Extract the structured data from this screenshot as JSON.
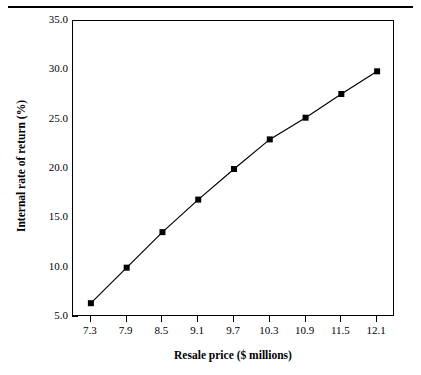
{
  "chart_data": {
    "type": "line",
    "title": "",
    "subtitle": "",
    "xlabel": "Resale price ($ millions)",
    "ylabel": "Internal rate of return (%)",
    "xlim": [
      7.0,
      12.4
    ],
    "ylim": [
      5.0,
      35.0
    ],
    "x_ticks": [
      7.3,
      7.9,
      8.5,
      9.1,
      9.7,
      10.3,
      10.9,
      11.5,
      12.1
    ],
    "x_tick_labels": [
      "7.3",
      "7.9",
      "8.5",
      "9.1",
      "9.7",
      "10.3",
      "10.9",
      "11.5",
      "12.1"
    ],
    "y_ticks": [
      5.0,
      10.0,
      15.0,
      20.0,
      25.0,
      30.0,
      35.0
    ],
    "y_tick_labels": [
      "5.0",
      "10.0",
      "15.0",
      "20.0",
      "25.0",
      "30.0",
      "35.0"
    ],
    "grid": false,
    "legend": null,
    "marker": "filled-square",
    "line_color": "#000000",
    "marker_color": "#000000",
    "x": [
      7.3,
      7.9,
      8.5,
      9.1,
      9.7,
      10.3,
      10.9,
      11.5,
      12.1
    ],
    "values": [
      6.4,
      10.0,
      13.6,
      16.9,
      20.0,
      23.0,
      25.2,
      27.6,
      29.9
    ],
    "series": [
      {
        "name": "Internal rate of return",
        "values": [
          6.4,
          10.0,
          13.6,
          16.9,
          20.0,
          23.0,
          25.2,
          27.6,
          29.9
        ]
      }
    ]
  }
}
